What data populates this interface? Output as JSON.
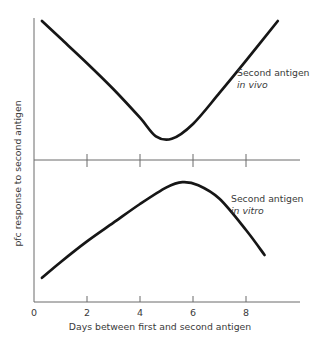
{
  "chart_data": {
    "type": "line",
    "title": "",
    "subtitle": "",
    "xlabel": "Days between first and second antigen",
    "ylabel": "pfc response to second antigen",
    "xlim": [
      0,
      9.6
    ],
    "ylim": [
      0,
      1
    ],
    "grid": false,
    "legend_position": "inline-annotation",
    "xticks": [
      {
        "value": 0,
        "label": "0"
      },
      {
        "value": 2,
        "label": "2"
      },
      {
        "value": 4,
        "label": "4"
      },
      {
        "value": 6,
        "label": "6"
      },
      {
        "value": 8,
        "label": "8"
      }
    ],
    "yticks": [],
    "panels": [
      {
        "name": "upper-panel",
        "annotation_line1": "Second antigen",
        "annotation_line2": "in vivo",
        "description": "U-shaped curve: pfc response falls to a minimum near day 4.5 then rises steeply",
        "series": [
          {
            "name": "Second antigen in vivo",
            "x": [
              0.3,
              1.0,
              2.0,
              3.0,
              4.0,
              4.6,
              5.2,
              6.0,
              7.0,
              8.0,
              9.2
            ],
            "y": [
              1.0,
              0.86,
              0.66,
              0.45,
              0.22,
              0.07,
              0.05,
              0.17,
              0.42,
              0.68,
              1.0
            ]
          }
        ]
      },
      {
        "name": "lower-panel",
        "annotation_line1": "Second antigen",
        "annotation_line2": "in vitro",
        "description": "Inverted-U curve: pfc response rises to a peak near day 5.6 then falls steeply",
        "series": [
          {
            "name": "Second antigen in vitro",
            "x": [
              0.3,
              1.0,
              2.0,
              3.0,
              4.0,
              5.0,
              5.6,
              6.2,
              7.0,
              8.0,
              8.7
            ],
            "y": [
              0.04,
              0.19,
              0.39,
              0.57,
              0.75,
              0.91,
              0.96,
              0.93,
              0.8,
              0.5,
              0.26
            ]
          }
        ]
      }
    ],
    "axes": {
      "y_axis_label": "pfc response to second antigen",
      "x_axis_label": "Days between first and second antigen",
      "divider_present": true,
      "divider_tick_values": [
        2,
        4,
        6,
        8
      ]
    },
    "colors": {
      "curve": "#161616",
      "axis": "#6b6b6b",
      "text": "#3a3a3a",
      "background": "#ffffff"
    }
  }
}
